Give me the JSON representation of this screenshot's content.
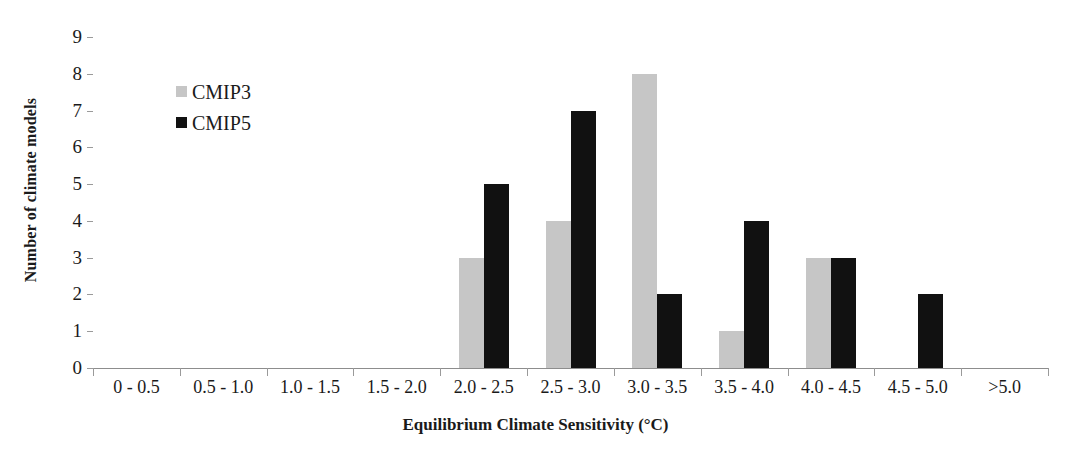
{
  "chart_data": {
    "type": "bar",
    "title": "",
    "xlabel": "Equilibrium Climate Sensitivity (°C)",
    "ylabel": "Number of climate models",
    "categories": [
      "0 - 0.5",
      "0.5 - 1.0",
      "1.0 - 1.5",
      "1.5 - 2.0",
      "2.0 - 2.5",
      "2.5 - 3.0",
      "3.0 - 3.5",
      "3.5 - 4.0",
      "4.0 - 4.5",
      "4.5 - 5.0",
      ">5.0"
    ],
    "series": [
      {
        "name": "CMIP3",
        "color": "#c6c6c6",
        "values": [
          0,
          0,
          0,
          0,
          3,
          4,
          8,
          1,
          3,
          0,
          0
        ]
      },
      {
        "name": "CMIP5",
        "color": "#111111",
        "values": [
          0,
          0,
          0,
          0,
          5,
          7,
          2,
          4,
          3,
          2,
          0
        ]
      }
    ],
    "ylim": [
      0,
      9
    ],
    "yticks": [
      "0",
      "1",
      "2",
      "3",
      "4",
      "5",
      "6",
      "7",
      "8",
      "9"
    ],
    "grid": false,
    "legend_position": "upper-left-inside"
  },
  "legend": {
    "entries": [
      {
        "label": "CMIP3",
        "swatch": "cmip3"
      },
      {
        "label": "CMIP5",
        "swatch": "cmip5"
      }
    ]
  }
}
